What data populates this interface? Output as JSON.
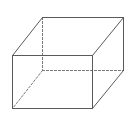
{
  "diagram": {
    "type": "cuboid",
    "stroke_color": "#5a5a5a",
    "hidden_stroke_color": "#7a7a7a",
    "vertices": {
      "front_top_left": [
        12,
        55
      ],
      "front_top_right": [
        92,
        55
      ],
      "front_bottom_right": [
        92,
        108
      ],
      "front_bottom_left": [
        12,
        108
      ],
      "back_top_left": [
        42,
        17
      ],
      "back_top_right": [
        123,
        17
      ],
      "back_bottom_right": [
        123,
        70
      ],
      "back_bottom_left": [
        42,
        70
      ]
    },
    "visible_edges": [
      [
        "front_top_left",
        "front_top_right"
      ],
      [
        "front_top_right",
        "front_bottom_right"
      ],
      [
        "front_bottom_right",
        "front_bottom_left"
      ],
      [
        "front_bottom_left",
        "front_top_left"
      ],
      [
        "front_top_left",
        "back_top_left"
      ],
      [
        "back_top_left",
        "back_top_right"
      ],
      [
        "front_top_right",
        "back_top_right"
      ],
      [
        "back_top_right",
        "back_bottom_right"
      ],
      [
        "front_bottom_right",
        "back_bottom_right"
      ]
    ],
    "hidden_edges": [
      [
        "back_top_left",
        "back_bottom_left"
      ],
      [
        "back_bottom_left",
        "back_bottom_right"
      ],
      [
        "back_bottom_left",
        "front_bottom_left"
      ]
    ]
  }
}
